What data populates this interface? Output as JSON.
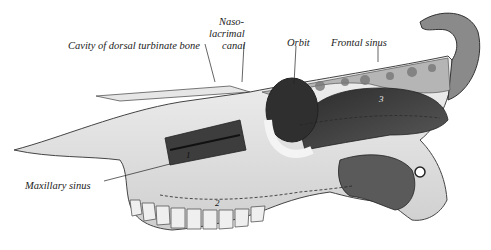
{
  "figure": {
    "labels": [
      {
        "id": "cavity-dorsal-turbinate",
        "text": "Cavity of dorsal turbinate bone",
        "x": 68,
        "y": 40
      },
      {
        "id": "naso-lacrimal-1",
        "text": "Naso-",
        "x": 219,
        "y": 16
      },
      {
        "id": "naso-lacrimal-2",
        "text": "lacrimal",
        "x": 209,
        "y": 28
      },
      {
        "id": "naso-lacrimal-3",
        "text": "canal",
        "x": 222,
        "y": 40
      },
      {
        "id": "orbit",
        "text": "Orbit",
        "x": 287,
        "y": 38
      },
      {
        "id": "frontal-sinus",
        "text": "Frontal sinus",
        "x": 331,
        "y": 38
      },
      {
        "id": "maxillary-sinus",
        "text": "Maxillary sinus",
        "x": 25,
        "y": 180
      }
    ],
    "numbers": [
      {
        "id": "num-1",
        "text": "1",
        "x": 186,
        "y": 152
      },
      {
        "id": "num-2",
        "text": "2",
        "x": 215,
        "y": 200
      },
      {
        "id": "num-3",
        "text": "3",
        "x": 379,
        "y": 96
      }
    ],
    "colors": {
      "ink": "#222222",
      "bone_light": "#eeeeee",
      "bone_mid": "#bdbdbd",
      "cavity_dark": "#3a3a3a",
      "background": "#ffffff"
    }
  }
}
